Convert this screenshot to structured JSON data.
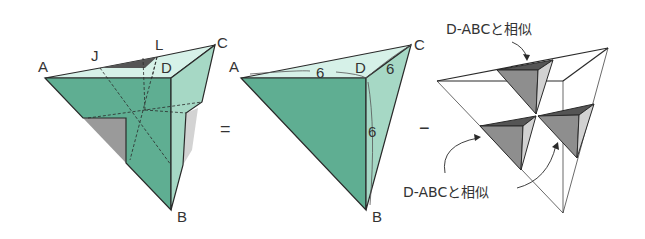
{
  "figure": {
    "left": {
      "description": "Solid with corner pyramids removed (equals regular tetrahedron D-ABC minus three similar small pyramids)",
      "vertex_labels": {
        "A": "A",
        "B": "B",
        "C": "C",
        "D": "D",
        "J": "J",
        "L": "L"
      }
    },
    "equals_sign": "=",
    "middle": {
      "description": "Triangular pyramid D-ABC",
      "vertex_labels": {
        "A": "A",
        "B": "B",
        "C": "C",
        "D": "D"
      },
      "edge_lengths": {
        "DA": "6",
        "DC": "6",
        "DB": "6"
      }
    },
    "minus_sign": "−",
    "right": {
      "description": "Three small pyramids removed, each similar to D-ABC",
      "annotation_top": "D-ABCと相似",
      "annotation_bottom": "D-ABCと相似"
    }
  },
  "colors": {
    "face_front": "#5fae92",
    "face_right": "#a6d8c5",
    "face_top": "#d6f1e8",
    "shadow_gray": "#8e8e8e",
    "dark_gray": "#555555",
    "light_gray": "#d2d2d2",
    "edge": "#2a2a2a"
  }
}
